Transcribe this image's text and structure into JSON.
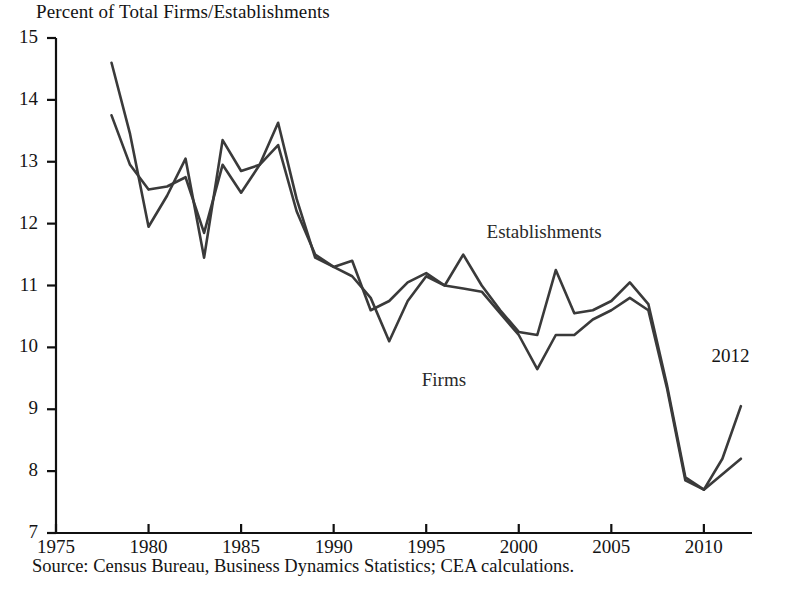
{
  "chart_data": {
    "type": "line",
    "title": "Percent of Total Firms/Establishments",
    "subtitle": "",
    "xlabel": "",
    "ylabel": "",
    "xlim": [
      1975,
      2012.6
    ],
    "ylim": [
      7,
      15
    ],
    "grid": false,
    "legend_position": "inline-annotations",
    "x_ticks": [
      1975,
      1980,
      1985,
      1990,
      1995,
      2000,
      2005,
      2010
    ],
    "x_tick_labels": [
      "1975",
      "1980",
      "1985",
      "1990",
      "1995",
      "2000",
      "2005",
      "2010"
    ],
    "y_ticks": [
      7,
      8,
      9,
      10,
      11,
      12,
      13,
      14,
      15
    ],
    "y_tick_labels": [
      "7",
      "8",
      "9",
      "10",
      "11",
      "12",
      "13",
      "14",
      "15"
    ],
    "x": [
      1978,
      1979,
      1980,
      1981,
      1982,
      1983,
      1984,
      1985,
      1986,
      1987,
      1988,
      1989,
      1990,
      1991,
      1992,
      1993,
      1994,
      1995,
      1996,
      1997,
      1998,
      1999,
      2000,
      2001,
      2002,
      2003,
      2004,
      2005,
      2006,
      2007,
      2008,
      2009,
      2010,
      2011,
      2012
    ],
    "series": [
      {
        "name": "Establishments",
        "color": "#3a3a3a",
        "values": [
          14.6,
          13.45,
          11.95,
          12.45,
          13.05,
          11.45,
          13.35,
          12.85,
          12.95,
          13.63,
          12.4,
          11.45,
          11.3,
          11.4,
          10.6,
          10.75,
          11.05,
          11.2,
          11.0,
          11.5,
          11.0,
          10.6,
          10.25,
          10.2,
          11.25,
          10.55,
          10.6,
          10.75,
          11.05,
          10.7,
          9.4,
          7.9,
          7.7,
          8.2,
          9.05
        ]
      },
      {
        "name": "Firms",
        "color": "#3a3a3a",
        "values": [
          13.75,
          12.95,
          12.55,
          12.6,
          12.75,
          11.85,
          12.95,
          12.5,
          12.95,
          13.27,
          12.2,
          11.5,
          11.3,
          11.15,
          10.8,
          10.1,
          10.75,
          11.15,
          11.0,
          10.95,
          10.9,
          10.55,
          10.2,
          9.65,
          10.2,
          10.2,
          10.45,
          10.6,
          10.8,
          10.6,
          9.35,
          7.85,
          7.7,
          7.95,
          8.2
        ]
      }
    ],
    "annotations": [
      {
        "text": "Establishments",
        "x": 2001.5,
        "y": 11.85
      },
      {
        "text": "Firms",
        "x": 1998.0,
        "y": 9.45
      },
      {
        "text": "2012",
        "x": 2011.6,
        "y": 9.85
      }
    ],
    "source": "Source: Census Bureau, Business Dynamics Statistics; CEA calculations."
  }
}
